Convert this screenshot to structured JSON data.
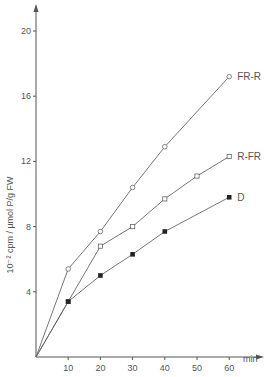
{
  "chart_data": {
    "type": "line",
    "title": "",
    "xlabel": "min",
    "ylabel": "10⁻² cpm / µmol P/g FW",
    "xlim": [
      0,
      65
    ],
    "ylim": [
      0,
      21
    ],
    "x_ticks": [
      10,
      20,
      30,
      40,
      50,
      60
    ],
    "y_ticks": [
      4,
      8,
      12,
      16,
      20
    ],
    "grid": false,
    "legend_position": "inline labels at line ends",
    "series": [
      {
        "name": "FR-R",
        "marker": "open-circle",
        "x": [
          0,
          10,
          20,
          30,
          40,
          60
        ],
        "values": [
          0,
          5.4,
          7.7,
          10.4,
          12.9,
          17.2
        ]
      },
      {
        "name": "R-FR",
        "marker": "open-square",
        "x": [
          0,
          10,
          20,
          30,
          40,
          50,
          60
        ],
        "values": [
          0,
          3.4,
          6.8,
          8.0,
          9.7,
          11.1,
          12.3
        ]
      },
      {
        "name": "D",
        "marker": "filled-square",
        "x": [
          0,
          10,
          20,
          30,
          40,
          60
        ],
        "values": [
          0,
          3.4,
          5.0,
          6.3,
          7.7,
          9.8
        ]
      }
    ]
  },
  "colors": {
    "axis": "#555555",
    "line": "#666666",
    "text": "#555555"
  }
}
